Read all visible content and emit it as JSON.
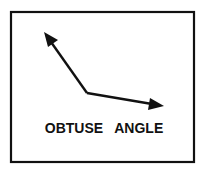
{
  "diagram": {
    "label": "OBTUSE   ANGLE",
    "colors": {
      "stroke": "#111111",
      "background": "#ffffff"
    },
    "vertex": [
      87,
      93
    ],
    "rays": [
      {
        "name": "upper-left-ray",
        "tip": [
          44,
          32
        ]
      },
      {
        "name": "right-ray",
        "tip": [
          164,
          106
        ]
      }
    ]
  }
}
